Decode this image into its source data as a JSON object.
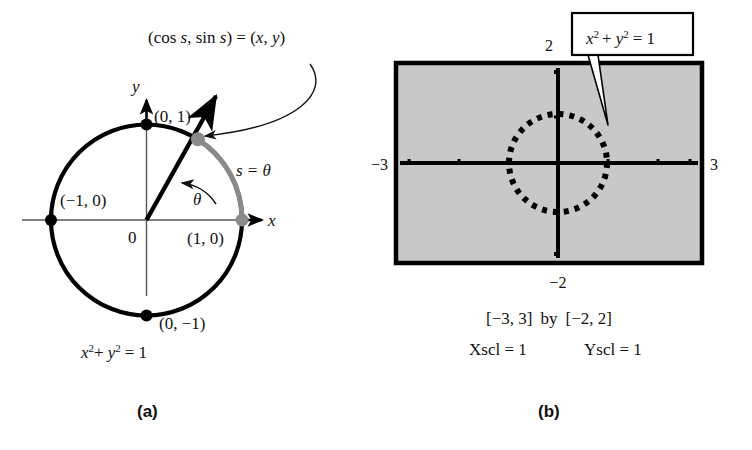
{
  "figure": {
    "panels": [
      {
        "id": "a",
        "caption": "(a)",
        "type": "unit-circle-diagram",
        "axis_labels": {
          "x": "x",
          "y": "y"
        },
        "origin_label": "0",
        "points": [
          {
            "name": "top",
            "label": "(0, 1)",
            "coords": [
              0,
              1
            ],
            "marker": "black-dot"
          },
          {
            "name": "left",
            "label": "(−1, 0)",
            "coords": [
              -1,
              0
            ],
            "marker": "black-dot"
          },
          {
            "name": "right",
            "label": "(1, 0)",
            "coords": [
              1,
              0
            ],
            "marker": "gray-dot"
          },
          {
            "name": "bottom",
            "label": "(0, −1)",
            "coords": [
              0,
              -1
            ],
            "marker": "black-dot"
          },
          {
            "name": "terminal",
            "label": "(cos s, sin s) = (x, y)",
            "coords": [
              0.53,
              0.85
            ],
            "marker": "gray-dot"
          }
        ],
        "arc_label": "s = θ",
        "angle_label": "θ",
        "equation": {
          "base1": "x",
          "sup1": "2",
          "plus": "+",
          "base2": "y",
          "sup2": "2",
          "rhs": "= 1"
        },
        "callout_text": "(cos s, sin s) = (x, y)",
        "callout_parts": {
          "open": "(cos ",
          "s1": "s",
          "comma": ", sin ",
          "s2": "s",
          "close": ") = (",
          "x": "x",
          "sep": ", ",
          "y": "y",
          "end": ")"
        },
        "colors": {
          "circle": "#000000",
          "arc_highlight": "#808080",
          "vector": "#000000",
          "axis": "#555555"
        }
      },
      {
        "id": "b",
        "caption": "(b)",
        "type": "graphing-calculator-screen",
        "screen_fill": "#c8c8c8",
        "screen_border": "#000000",
        "axis_labels": {
          "top": "2",
          "left": "−3",
          "right": "3",
          "bottom": "−2"
        },
        "callout_box": {
          "base1": "x",
          "sup1": "2",
          "plus": "+",
          "base2": "y",
          "sup2": "2",
          "rhs": "= 1"
        },
        "callout_box_text": "x² + y² = 1",
        "window_line": "[−3, 3]  by  [−2, 2]",
        "window_parts": {
          "x_range": "[−3, 3]",
          "by": "by",
          "y_range": "[−2, 2]"
        },
        "scale_line": {
          "xscl": "Xscl = 1",
          "yscl": "Yscl = 1"
        },
        "plotted_curve": "unit circle (dotted)",
        "xscl_value": 1,
        "yscl_value": 1,
        "xmin": -3,
        "xmax": 3,
        "ymin": -2,
        "ymax": 2
      }
    ]
  }
}
